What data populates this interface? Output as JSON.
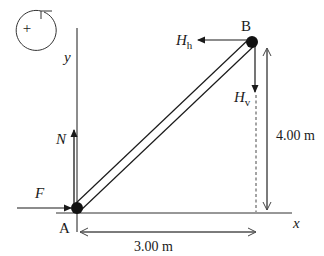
{
  "diagram": {
    "rotation_indicator": {
      "symbol": "+",
      "direction": "counterclockwise"
    },
    "axes": {
      "x_label": "x",
      "y_label": "y"
    },
    "points": {
      "A": {
        "label": "A"
      },
      "B": {
        "label": "B"
      }
    },
    "forces": {
      "F": {
        "label": "F",
        "direction": "right"
      },
      "N": {
        "label": "N",
        "direction": "up"
      },
      "H_h": {
        "label": "H",
        "subscript": "h",
        "direction": "left"
      },
      "H_v": {
        "label": "H",
        "subscript": "v",
        "direction": "down"
      }
    },
    "dimensions": {
      "horizontal": {
        "label": "3.00 m"
      },
      "vertical": {
        "label": "4.00 m"
      }
    },
    "colors": {
      "line": "#1a1a1a",
      "dim": "#555555"
    }
  }
}
